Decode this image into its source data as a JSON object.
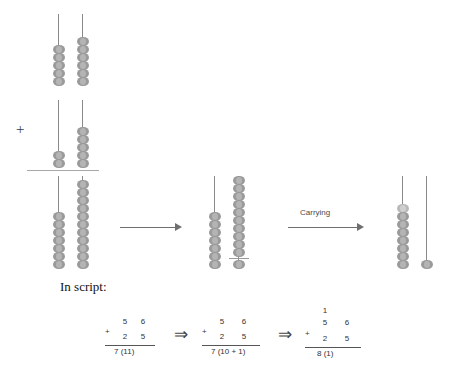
{
  "figure": {
    "title_text": "In script:",
    "carrying_label": "Carrying",
    "plus_sign": "+",
    "transform_arrow_glyph": "⇒"
  },
  "abacus": {
    "addend1": {
      "name": "56",
      "tens_beads": 5,
      "ones_beads": 6
    },
    "addend2": {
      "name": "25",
      "tens_beads": 2,
      "ones_beads": 5
    },
    "sum_raw": {
      "name": "7 and 11",
      "tens_beads": 7,
      "ones_beads": 11
    },
    "sum_split": {
      "name": "7 and 10 + 1",
      "tens_beads": 7,
      "ones_beads": 11,
      "split_after": 10
    },
    "sum_carried": {
      "name": "81",
      "tens_beads": 8,
      "ones_beads": 1,
      "carried_bead_index": 0
    }
  },
  "script": {
    "steps": [
      {
        "carry": "",
        "top": [
          "5",
          "6"
        ],
        "operator": "+",
        "bottom": [
          "2",
          "5"
        ],
        "result": "7  (11)"
      },
      {
        "carry": "",
        "top": [
          "5",
          "6"
        ],
        "operator": "+",
        "bottom": [
          "2",
          "5"
        ],
        "result": "7  (10 + 1)"
      },
      {
        "carry": "1",
        "top": [
          "5",
          "6"
        ],
        "operator": "+",
        "bottom": [
          "2",
          "5"
        ],
        "result": "8    (1)"
      }
    ]
  },
  "colors": {
    "bead": "#9a9a9a",
    "bead_light": "#b9b9b9",
    "wire": "#8a8a8a",
    "arrow": "#6f6f6f",
    "rule": "#a8a8a8",
    "text": "#111111"
  }
}
